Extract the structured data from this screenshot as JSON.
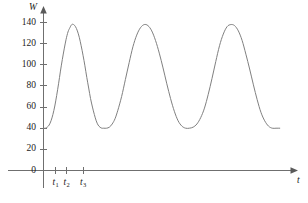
{
  "chart_data": {
    "type": "line",
    "title": "",
    "subtitle": "",
    "xlabel": "t",
    "ylabel": "W",
    "grid": false,
    "legend": "none",
    "xlim": [
      0,
      13.2
    ],
    "ylim": [
      0,
      148
    ],
    "y_ticks": [
      {
        "value": 0,
        "label": "0"
      },
      {
        "value": 20,
        "label": "20"
      },
      {
        "value": 40,
        "label": "40"
      },
      {
        "value": 60,
        "label": "60"
      },
      {
        "value": 80,
        "label": "80"
      },
      {
        "value": 100,
        "label": "100"
      },
      {
        "value": 120,
        "label": "120"
      },
      {
        "value": 140,
        "label": "140"
      }
    ],
    "x_ticks": [
      {
        "value": 0.63,
        "label": "t",
        "sub": "1"
      },
      {
        "value": 1.22,
        "label": "t",
        "sub": "2"
      },
      {
        "value": 2.1,
        "label": "t",
        "sub": "3"
      }
    ],
    "series": [
      {
        "name": "W",
        "baseline": 40,
        "peak": 138,
        "period": 4.15,
        "points": [
          [
            0.0,
            40
          ],
          [
            0.1,
            40
          ],
          [
            0.2,
            41
          ],
          [
            0.3,
            43
          ],
          [
            0.4,
            47
          ],
          [
            0.5,
            53
          ],
          [
            0.6,
            61
          ],
          [
            0.7,
            71
          ],
          [
            0.8,
            82
          ],
          [
            0.9,
            94
          ],
          [
            1.0,
            105
          ],
          [
            1.1,
            115
          ],
          [
            1.2,
            124
          ],
          [
            1.3,
            131
          ],
          [
            1.4,
            135
          ],
          [
            1.5,
            138
          ],
          [
            1.6,
            138
          ],
          [
            1.7,
            136
          ],
          [
            1.8,
            132
          ],
          [
            1.9,
            126
          ],
          [
            2.0,
            118
          ],
          [
            2.1,
            109
          ],
          [
            2.2,
            99
          ],
          [
            2.3,
            88
          ],
          [
            2.4,
            78
          ],
          [
            2.5,
            68
          ],
          [
            2.6,
            60
          ],
          [
            2.7,
            53
          ],
          [
            2.8,
            47
          ],
          [
            2.9,
            43
          ],
          [
            3.0,
            41
          ],
          [
            3.1,
            40
          ],
          [
            3.2,
            40
          ],
          [
            3.35,
            40
          ],
          [
            3.5,
            41
          ],
          [
            3.65,
            44
          ],
          [
            3.8,
            49
          ],
          [
            3.95,
            57
          ],
          [
            4.15,
            70
          ],
          [
            4.35,
            86
          ],
          [
            4.55,
            102
          ],
          [
            4.75,
            117
          ],
          [
            4.95,
            128
          ],
          [
            5.15,
            135
          ],
          [
            5.35,
            138
          ],
          [
            5.55,
            137
          ],
          [
            5.75,
            132
          ],
          [
            5.95,
            123
          ],
          [
            6.15,
            111
          ],
          [
            6.35,
            97
          ],
          [
            6.55,
            82
          ],
          [
            6.75,
            68
          ],
          [
            6.95,
            56
          ],
          [
            7.15,
            47
          ],
          [
            7.35,
            42
          ],
          [
            7.55,
            40
          ],
          [
            7.75,
            40
          ],
          [
            7.95,
            41
          ],
          [
            8.15,
            44
          ],
          [
            8.35,
            50
          ],
          [
            8.55,
            59
          ],
          [
            8.75,
            72
          ],
          [
            8.95,
            87
          ],
          [
            9.15,
            103
          ],
          [
            9.35,
            118
          ],
          [
            9.55,
            129
          ],
          [
            9.75,
            136
          ],
          [
            9.95,
            138
          ],
          [
            10.15,
            137
          ],
          [
            10.35,
            132
          ],
          [
            10.55,
            123
          ],
          [
            10.75,
            110
          ],
          [
            10.95,
            96
          ],
          [
            11.15,
            81
          ],
          [
            11.35,
            67
          ],
          [
            11.55,
            55
          ],
          [
            11.75,
            47
          ],
          [
            11.95,
            42
          ],
          [
            12.15,
            40
          ],
          [
            12.35,
            40
          ],
          [
            12.55,
            40
          ]
        ]
      }
    ]
  },
  "colors": {
    "curve": "#808080",
    "axis": "#6f6f6f",
    "text": "#1b1b1b",
    "background": "#ffffff"
  }
}
